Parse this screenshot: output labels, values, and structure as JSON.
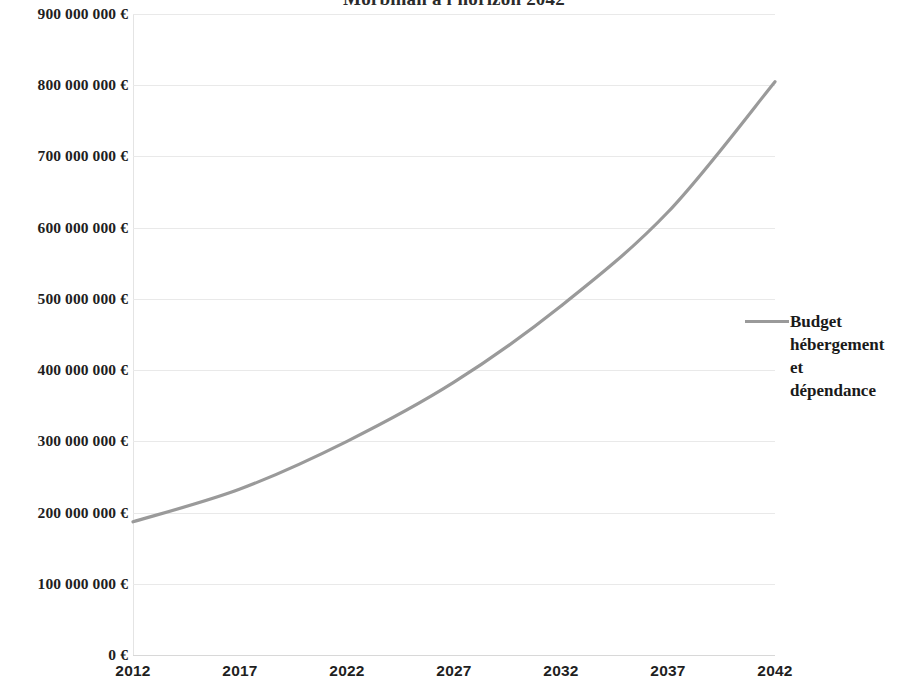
{
  "chart_data": {
    "type": "line",
    "title": "Morbihan à l'horizon 2042",
    "xlabel": "",
    "ylabel": "",
    "x": [
      2012,
      2017,
      2022,
      2027,
      2032,
      2037,
      2042
    ],
    "categories": [
      "2012",
      "2017",
      "2022",
      "2027",
      "2032",
      "2037",
      "2042"
    ],
    "series": [
      {
        "name": "Budget hébergement et dépendance",
        "color": "#9a9a9a",
        "values": [
          187000000,
          233000000,
          300000000,
          383000000,
          490000000,
          622000000,
          805000000
        ]
      }
    ],
    "xlim": [
      2012,
      2042
    ],
    "ylim": [
      0,
      900000000
    ],
    "y_ticks": [
      0,
      100000000,
      200000000,
      300000000,
      400000000,
      500000000,
      600000000,
      700000000,
      800000000,
      900000000
    ],
    "y_tick_labels": [
      "0 €",
      "100 000 000 €",
      "200 000 000 €",
      "300 000 000 €",
      "400 000 000 €",
      "500 000 000 €",
      "600 000 000 €",
      "700 000 000 €",
      "800 000 000 €",
      "900 000 000 €"
    ],
    "x_tick_labels": [
      "2012",
      "2017",
      "2022",
      "2027",
      "2032",
      "2037",
      "2042"
    ],
    "grid": true,
    "grid_axis": "y",
    "legend": {
      "position": "right",
      "entries": [
        {
          "label": "Budget hébergement et dépendance",
          "label_lines": [
            "Budget",
            "hébergement",
            "et",
            "dépendance"
          ],
          "color": "#9a9a9a",
          "marker": "line"
        }
      ]
    }
  },
  "colors": {
    "series_line": "#9a9a9a",
    "grid": "#e9e9e9",
    "text": "#1f1f1f",
    "background": "#ffffff"
  }
}
